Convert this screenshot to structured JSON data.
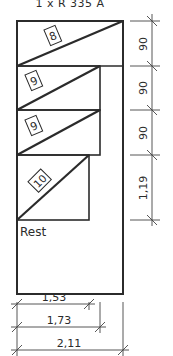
{
  "title": "1 x R 335 A",
  "colors": {
    "ink": "#2b2b2b",
    "thin": "#444444",
    "background": "#ffffff"
  },
  "strips": [
    {
      "label": "8",
      "top": 21,
      "bottom": 66,
      "right": 123
    },
    {
      "label": "9",
      "top": 66,
      "bottom": 110,
      "right": 100
    },
    {
      "label": "9",
      "top": 110,
      "bottom": 155,
      "right": 100
    },
    {
      "label": "10",
      "top": 155,
      "bottom": 220,
      "right": 89
    }
  ],
  "rest_label": "Rest",
  "dimensions": {
    "vertical": [
      "90",
      "90",
      "90",
      "1,19"
    ],
    "horizontal": [
      "1,53",
      "1,73",
      "2,11"
    ]
  }
}
